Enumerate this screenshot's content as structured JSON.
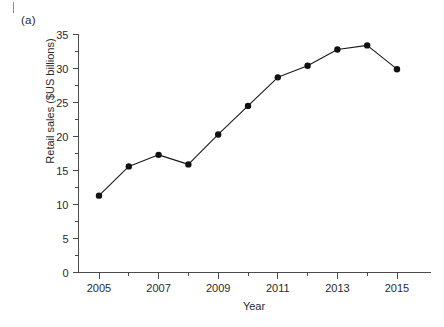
{
  "figure": {
    "panel_label": "(a)",
    "page_mark": "page-edge-tick"
  },
  "chart_data": {
    "type": "line",
    "title": "",
    "subtitle": "",
    "xlabel": "Year",
    "ylabel": "Retail sales ($US billions)",
    "x": [
      2005,
      2006,
      2007,
      2008,
      2009,
      2010,
      2011,
      2012,
      2013,
      2014,
      2015
    ],
    "values": [
      11.3,
      15.6,
      17.3,
      15.9,
      20.3,
      24.5,
      28.7,
      30.4,
      32.8,
      33.4,
      29.9
    ],
    "series": [
      {
        "name": "Retail sales",
        "values": [
          11.3,
          15.6,
          17.3,
          15.9,
          20.3,
          24.5,
          28.7,
          30.4,
          32.8,
          33.4,
          29.9
        ]
      }
    ],
    "xlim": [
      2004.4,
      2015.9
    ],
    "ylim": [
      0,
      35
    ],
    "x_tick_labels": [
      "2005",
      "2007",
      "2009",
      "2011",
      "2013",
      "2015"
    ],
    "x_ticks_major": [
      2005,
      2007,
      2009,
      2011,
      2013,
      2015
    ],
    "x_ticks_minor": [
      2006,
      2008,
      2010,
      2012,
      2014
    ],
    "y_tick_labels": [
      "0",
      "5",
      "10",
      "15",
      "20",
      "25",
      "30",
      "35"
    ],
    "y_ticks_major": [
      0,
      5,
      10,
      15,
      20,
      25,
      30,
      35
    ],
    "y_ticks_minor": [
      2.5,
      7.5,
      12.5,
      17.5,
      22.5,
      27.5,
      32.5
    ],
    "grid": false,
    "legend": false,
    "legend_position": "none",
    "marker": "filled-circle",
    "line_color": "#1a1a1a",
    "marker_color": "#111111",
    "background_color": "#ffffff"
  }
}
